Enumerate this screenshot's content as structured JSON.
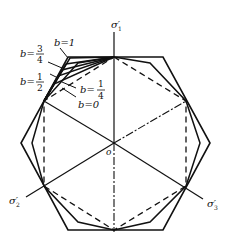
{
  "diagram": {
    "type": "yield-locus-pi-plane",
    "axes": {
      "sigma1": "σ′₁",
      "sigma2": "σ′₂",
      "sigma3": "σ′₃",
      "origin": "o"
    },
    "curves": [
      {
        "param": "b=1",
        "label_text": "b=1"
      },
      {
        "param": "b=3/4",
        "label_prefix": "b=",
        "num": "3",
        "den": "4"
      },
      {
        "param": "b=1/2",
        "label_prefix": "b=",
        "num": "1",
        "den": "2"
      },
      {
        "param": "b=1/4",
        "label_prefix": "b=",
        "num": "1",
        "den": "4"
      },
      {
        "param": "b=0",
        "label_text": "b=0"
      }
    ],
    "labels": {
      "b1": "b=1",
      "b34_prefix": "b=",
      "b34_num": "3",
      "b34_den": "4",
      "b12_prefix": "b=",
      "b12_num": "1",
      "b12_den": "2",
      "b14_prefix": "b=",
      "b14_num": "1",
      "b14_den": "4",
      "b0": "b=0",
      "sigma1": "σ′",
      "sigma1_sub": "1",
      "sigma2": "σ′",
      "sigma2_sub": "2",
      "sigma3": "σ′",
      "sigma3_sub": "3",
      "origin": "o"
    },
    "colors": {
      "line": "#111111",
      "background": "#ffffff"
    }
  }
}
